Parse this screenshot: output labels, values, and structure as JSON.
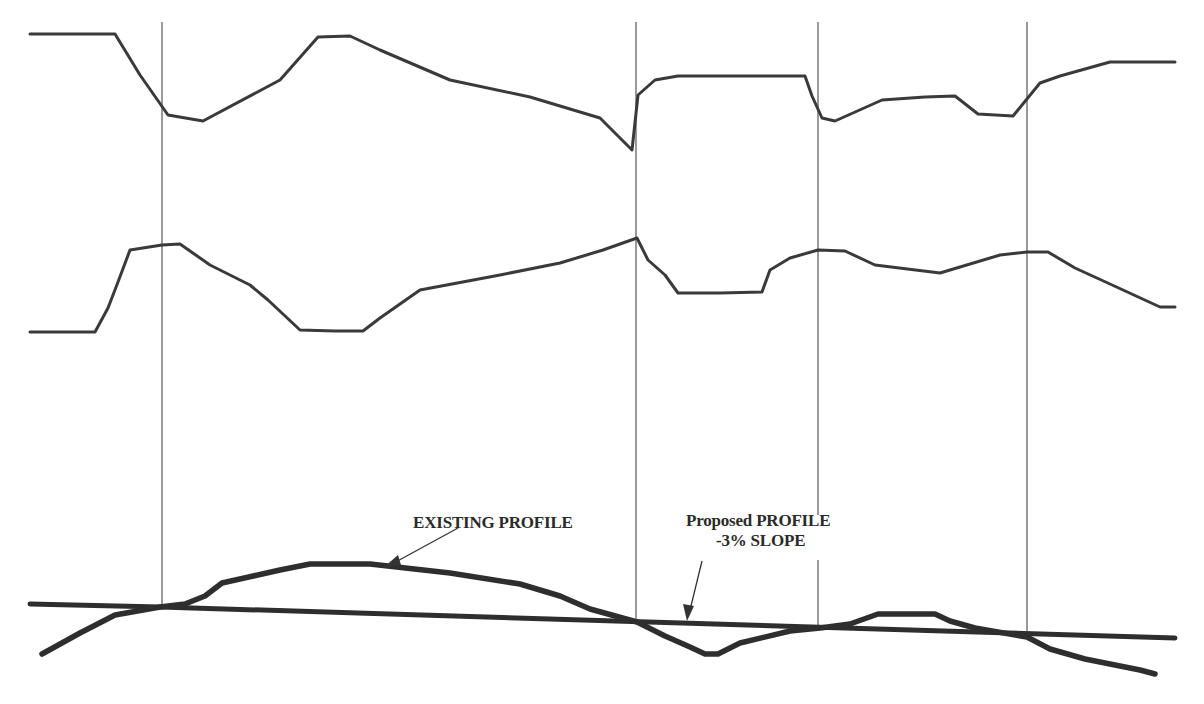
{
  "diagram": {
    "type": "road-profile-diagram",
    "colors": {
      "line": "#3a3a3a",
      "profile": "#2e2e2e",
      "station_line": "#555555",
      "background": "#ffffff"
    },
    "labels": {
      "existing_profile": "EXISTING PROFILE",
      "proposed_profile_line1": "Proposed PROFILE",
      "proposed_profile_line2": "-3% SLOPE"
    },
    "station_lines_x": [
      162,
      636,
      818,
      1027
    ],
    "plan_view": {
      "upper_edge_points": "30,34 115,34 140,75 168,115 203,121 280,80 318,37 350,36 380,50 450,80 530,97 600,118 632,150 638,95 655,80 678,76 770,76 805,76 812,96 822,118 835,121 882,100 925,97 955,96 978,114 1013,116 1040,83 1060,76 1110,62 1175,62",
      "lower_edge_points": "30,332 95,332 108,308 118,282 130,250 162,245 180,244 210,265 250,285 268,300 300,330 335,331 363,331 380,318 420,290 500,275 560,263 603,250 637,238 648,260 665,275 678,293 720,293 762,292 770,270 790,258 818,250 845,251 875,265 940,273 1000,255 1027,252 1048,252 1075,268 1110,284 1160,307 1175,307"
    },
    "profile_view": {
      "existing_points": "42,654 80,633 115,615 160,607 185,604 205,596 222,583 280,570 310,564 370,564 450,573 520,584 560,596 590,609 637,622 665,636 690,647 705,654 718,654 740,643 790,631 820,628 850,624 878,614 935,614 950,621 975,628 1027,637 1050,649 1085,659 1140,670 1155,674",
      "proposed_points": "30,604 160,607 1175,638"
    }
  }
}
